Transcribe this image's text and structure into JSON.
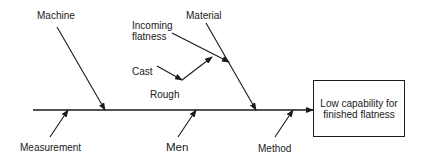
{
  "diagram": {
    "type": "fishbone",
    "effect": "Low capability for finished flatness",
    "causes_top": {
      "machine": "Machine",
      "material": "Material",
      "incoming_flatness": "Incoming flatness",
      "cast": "Cast",
      "rough": "Rough"
    },
    "causes_bottom": {
      "measurement": "Measurement",
      "men": "Men",
      "method": "Method"
    },
    "line_color": "#1a1a1a"
  }
}
